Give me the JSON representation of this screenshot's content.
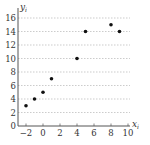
{
  "chart_data": {
    "type": "scatter",
    "title": "",
    "xlabel": "x",
    "xlabel_sub": "i",
    "ylabel": "y",
    "ylabel_sub": "i",
    "xlim": [
      -2,
      10
    ],
    "ylim": [
      0,
      16
    ],
    "xticks": [
      -2,
      0,
      2,
      4,
      6,
      8,
      10
    ],
    "yticks": [
      0,
      2,
      4,
      6,
      8,
      10,
      12,
      14,
      16
    ],
    "grid": "horizontal-dashed",
    "legend": "none",
    "series": [
      {
        "name": "points",
        "color": "#111111",
        "points": [
          {
            "x": -2,
            "y": 3
          },
          {
            "x": -1,
            "y": 4
          },
          {
            "x": 0,
            "y": 5
          },
          {
            "x": 1,
            "y": 7
          },
          {
            "x": 4,
            "y": 10
          },
          {
            "x": 5,
            "y": 14
          },
          {
            "x": 8,
            "y": 15
          },
          {
            "x": 9,
            "y": 14
          }
        ]
      }
    ],
    "colors": {
      "axis": "#555555",
      "grid": "#aaaaaa",
      "text": "#333333"
    }
  }
}
